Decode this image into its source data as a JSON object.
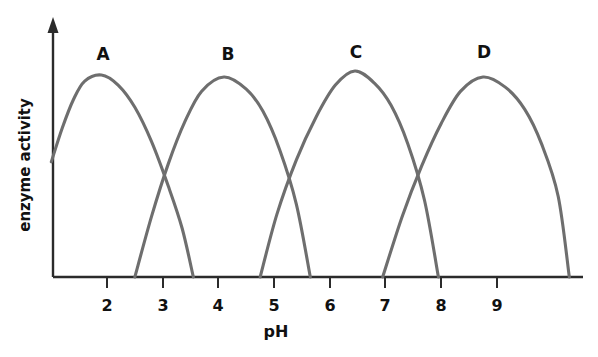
{
  "chart_data": {
    "type": "line",
    "title": "",
    "xlabel": "pH",
    "ylabel": "enzyme activity",
    "xlim": [
      1.0,
      10.5
    ],
    "ylim": [
      0,
      1.1
    ],
    "grid": false,
    "legend_position": "inline-peak-labels",
    "xticks": [
      2,
      3,
      4,
      5,
      6,
      7,
      8,
      9
    ],
    "xtick_labels": [
      "2",
      "3",
      "4",
      "5",
      "6",
      "7",
      "8",
      "9"
    ],
    "yticks": [],
    "ytick_labels": [],
    "annotations": [
      "A",
      "B",
      "C",
      "D"
    ],
    "series": [
      {
        "name": "A",
        "label": "A",
        "color": "#6e6e6e",
        "peak_ph": 1.9,
        "peak_activity": 1.0,
        "start_ph": 1.0,
        "end_ph": 3.55,
        "x": [
          1.0,
          1.2,
          1.4,
          1.6,
          1.9,
          2.2,
          2.5,
          2.8,
          3.1,
          3.35,
          3.55
        ],
        "y": [
          0.57,
          0.74,
          0.88,
          0.97,
          1.0,
          0.95,
          0.84,
          0.67,
          0.45,
          0.24,
          0.0
        ]
      },
      {
        "name": "B",
        "label": "B",
        "color": "#6e6e6e",
        "peak_ph": 4.1,
        "peak_activity": 0.99,
        "start_ph": 2.5,
        "end_ph": 5.65,
        "x": [
          2.5,
          2.8,
          3.1,
          3.4,
          3.7,
          4.1,
          4.5,
          4.8,
          5.1,
          5.4,
          5.65
        ],
        "y": [
          0.0,
          0.3,
          0.56,
          0.77,
          0.92,
          0.99,
          0.93,
          0.82,
          0.63,
          0.36,
          0.0
        ]
      },
      {
        "name": "C",
        "label": "C",
        "color": "#6e6e6e",
        "peak_ph": 6.45,
        "peak_activity": 1.02,
        "start_ph": 4.75,
        "end_ph": 7.95,
        "x": [
          4.75,
          5.05,
          5.4,
          5.75,
          6.1,
          6.45,
          6.8,
          7.1,
          7.4,
          7.7,
          7.95
        ],
        "y": [
          0.0,
          0.31,
          0.58,
          0.79,
          0.95,
          1.02,
          0.96,
          0.85,
          0.66,
          0.38,
          0.0
        ]
      },
      {
        "name": "D",
        "label": "D",
        "color": "#6e6e6e",
        "peak_ph": 8.75,
        "peak_activity": 0.99,
        "start_ph": 6.95,
        "end_ph": 10.3,
        "x": [
          6.95,
          7.3,
          7.65,
          8.0,
          8.35,
          8.75,
          9.15,
          9.5,
          9.8,
          10.1,
          10.3
        ],
        "y": [
          0.0,
          0.3,
          0.55,
          0.76,
          0.92,
          0.99,
          0.94,
          0.83,
          0.66,
          0.4,
          0.0
        ]
      }
    ]
  },
  "axes": {
    "x_title": "pH",
    "y_title": "enzyme activity",
    "y_arrow": "up-arrow-icon"
  },
  "ticks": {
    "x": [
      {
        "label": "2"
      },
      {
        "label": "3"
      },
      {
        "label": "4"
      },
      {
        "label": "5"
      },
      {
        "label": "6"
      },
      {
        "label": "7"
      },
      {
        "label": "8"
      },
      {
        "label": "9"
      }
    ]
  },
  "curve_labels": [
    {
      "text": "A"
    },
    {
      "text": "B"
    },
    {
      "text": "C"
    },
    {
      "text": "D"
    }
  ],
  "colors": {
    "curve": "#6e6e6e",
    "axis": "#2b2b2b",
    "text": "#111111",
    "background": "#ffffff"
  }
}
